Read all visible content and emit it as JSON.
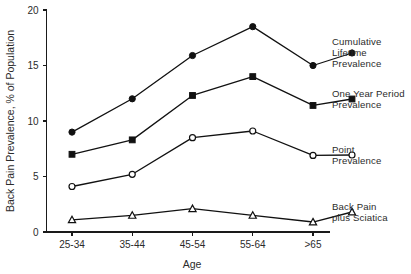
{
  "chart_data": {
    "type": "line",
    "title": "",
    "xlabel": "Age",
    "ylabel": "Back Pain Prevalence, % of Population",
    "categories": [
      "25-34",
      "35-44",
      "45-54",
      "55-64",
      ">65"
    ],
    "ylim": [
      0,
      20
    ],
    "yticks": [
      0,
      5,
      10,
      15,
      20
    ],
    "ytick_labels": [
      "0",
      "5",
      "10",
      "15",
      "20"
    ],
    "grid": false,
    "legend_position": "right-inline-annotations",
    "series": [
      {
        "name": "Cumulative Lifetime Prevalence",
        "label": "Cumulative\nLifetime\nPrevalence",
        "marker": "filled-circle",
        "values": [
          9.0,
          12.0,
          15.9,
          18.5,
          15.0
        ]
      },
      {
        "name": "One Year Period Prevalence",
        "label": "One Year Period\nPrevalence",
        "marker": "filled-square",
        "values": [
          7.0,
          8.3,
          12.3,
          14.0,
          11.4
        ]
      },
      {
        "name": "Point Prevalence",
        "label": "Point\nPrevalence",
        "marker": "open-circle",
        "values": [
          4.1,
          5.2,
          8.5,
          9.1,
          6.9
        ]
      },
      {
        "name": "Back Pain plus Sciatica",
        "label": "Back Pain\nplus Sciatica",
        "marker": "open-triangle",
        "values": [
          1.1,
          1.5,
          2.1,
          1.5,
          0.9
        ]
      }
    ]
  },
  "axis": {
    "y_title": "Back Pain Prevalence, % of Population",
    "x_title": "Age"
  },
  "colors": {
    "ink": "#111111",
    "background": "#ffffff"
  }
}
